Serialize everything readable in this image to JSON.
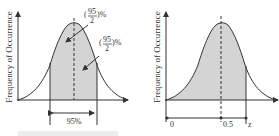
{
  "left_panel": {
    "y_axis_label": "Frequency of Occurrence",
    "annotation_top": {
      "numerator": "95",
      "denominator": "2",
      "prefix": "(",
      "suffix": ")%"
    },
    "annotation_right": {
      "numerator": "95",
      "denominator": "2",
      "prefix": "(",
      "suffix": ")%"
    },
    "interval_label": "95%",
    "cut_off_caption": "(faint, cut-off text)"
  },
  "right_panel": {
    "y_axis_label": "Frequency of Occurrence",
    "x_labels": [
      "0",
      "0.5",
      "z"
    ]
  },
  "colors": {
    "shade": "#d4d4d4",
    "line": "#333333",
    "background": "#ffffff"
  }
}
